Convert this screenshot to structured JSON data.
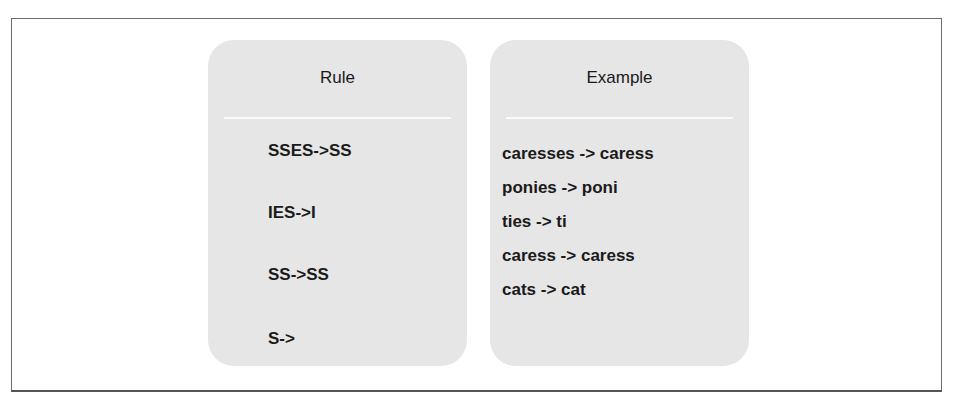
{
  "colors": {
    "panel_bg": "#e6e6e6",
    "frame_border": "#6b6b6b",
    "text": "#1a1a1a"
  },
  "rule_panel": {
    "title": "Rule",
    "items": [
      "SSES->SS",
      "IES->I",
      "SS->SS",
      "S->"
    ]
  },
  "example_panel": {
    "title": "Example",
    "items": [
      "caresses -> caress",
      "ponies -> poni",
      "ties -> ti",
      "caress -> caress",
      "cats -> cat"
    ]
  }
}
